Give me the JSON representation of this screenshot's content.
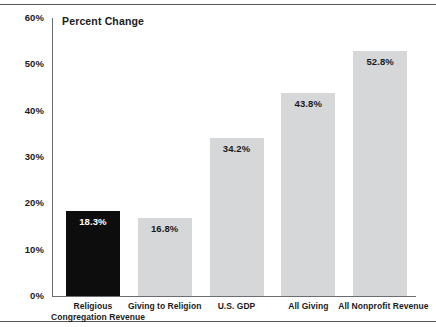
{
  "chart_data": {
    "type": "bar",
    "title": "Percent Change",
    "xlabel": "",
    "ylabel": "",
    "ylim": [
      0,
      60
    ],
    "grid": false,
    "legend": "none",
    "ytick_labels": [
      "60%",
      "50%",
      "40%",
      "30%",
      "20%",
      "10%",
      "0%"
    ],
    "ytick_values": [
      60,
      50,
      40,
      30,
      20,
      10,
      0
    ],
    "categories": [
      "Religious Congregation Revenue",
      "Giving to Religion",
      "U.S. GDP",
      "All Giving",
      "All Nonprofit Revenue"
    ],
    "values": [
      18.3,
      16.8,
      34.2,
      43.8,
      52.8
    ],
    "value_labels": [
      "18.3%",
      "16.8%",
      "34.2%",
      "43.8%",
      "52.8%"
    ],
    "bars": [
      {
        "label_lines": [
          "Religious",
          "Congregation Revenue"
        ],
        "value": 18.3,
        "value_label": "18.3%",
        "color": "#0d0d0d",
        "label_color": "#ffffff"
      },
      {
        "label_lines": [
          "Giving to Religion"
        ],
        "value": 16.8,
        "value_label": "16.8%",
        "color": "#d6d7d8",
        "label_color": "#1b1b1b"
      },
      {
        "label_lines": [
          "U.S. GDP"
        ],
        "value": 34.2,
        "value_label": "34.2%",
        "color": "#d6d7d8",
        "label_color": "#1b1b1b"
      },
      {
        "label_lines": [
          "All Giving"
        ],
        "value": 43.8,
        "value_label": "43.8%",
        "color": "#d6d7d8",
        "label_color": "#1b1b1b"
      },
      {
        "label_lines": [
          "All Nonprofit Revenue"
        ],
        "value": 52.8,
        "value_label": "52.8%",
        "color": "#d6d7d8",
        "label_color": "#1b1b1b"
      }
    ],
    "colors": {
      "highlight_bar": "#0d0d0d",
      "default_bar": "#d6d7d8",
      "axis": "#6a6d71",
      "rule": "#55585c",
      "text": "#1b1b1b",
      "background": "#ffffff"
    }
  }
}
